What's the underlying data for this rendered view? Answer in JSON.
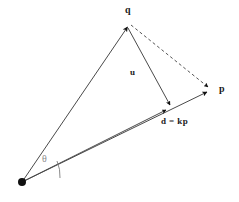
{
  "figure": {
    "type": "vector-projection-diagram",
    "background_color": "#ffffff",
    "line_color": "#4a4a4a",
    "arrow_color": "#111111",
    "dash_color": "#555555",
    "theta_color": "#8a8a8a"
  },
  "labels": {
    "q": "q",
    "p": "p",
    "u": "u",
    "d": "d = kp",
    "theta": "θ"
  },
  "points": {
    "origin": {
      "x": 22,
      "y": 182
    },
    "q_tip": {
      "x": 128,
      "y": 25
    },
    "p_tip": {
      "x": 210,
      "y": 90
    },
    "d_tip": {
      "x": 168,
      "y": 108
    }
  },
  "elements": {
    "origin_dot": "filled-black-circle",
    "vector_q": "solid-arrow-origin-to-q",
    "vector_p": "solid-arrow-origin-to-p",
    "vector_d": "solid-arrow-origin-to-d",
    "vector_u": "solid-arrow-q-to-d",
    "segment_qp": "dashed-line-q-to-p",
    "angle_arc": "theta-arc-at-origin"
  }
}
